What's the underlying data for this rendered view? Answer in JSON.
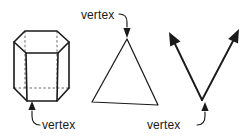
{
  "diagram": {
    "background_color": "#ffffff",
    "line_color": "#1a1a1a",
    "hidden_line_color": "#555555",
    "figures": [
      {
        "name": "hexagonal-prism",
        "shape": "hexagonal prism",
        "label": "vertex",
        "label_points_to": "bottom front vertex of prism",
        "hidden_edges": true
      },
      {
        "name": "triangle",
        "shape": "triangle",
        "label": "vertex",
        "label_points_to": "top apex of triangle",
        "hidden_edges": false
      },
      {
        "name": "angle",
        "shape": "angle formed by two rays",
        "label": "vertex",
        "label_points_to": "common endpoint of the two rays",
        "hidden_edges": false
      }
    ],
    "labels": {
      "prism_vertex": "vertex",
      "triangle_vertex": "vertex",
      "angle_vertex": "vertex"
    }
  }
}
